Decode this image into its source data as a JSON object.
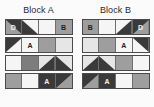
{
  "figure": {
    "type": "diagram"
  },
  "palette": {
    "dark": "#3a3a3a",
    "mid_dark": "#7d7d7d",
    "mid": "#9e9e9e",
    "light": "#cfcfcf",
    "pale": "#e6e6e6",
    "white": "#f5f5f5",
    "outline": "#4a4a4a",
    "label_light": "#f2f2f2",
    "label_dark": "#1f1f1f",
    "background": "#fbfbfb"
  },
  "blocks": [
    {
      "title": "Block A",
      "rows": [
        {
          "cells": [
            {
              "fill": "dark",
              "triangle": "bottom-left",
              "triangle_fill": "mid",
              "label": "D",
              "label_color": "label_light"
            },
            {
              "fill": "white",
              "triangle": "bottom-left",
              "triangle_fill": "dark",
              "label": "",
              "label_color": "label_dark"
            },
            {
              "fill": "white",
              "triangle": "none",
              "triangle_fill": "",
              "label": "",
              "label_color": "label_dark"
            },
            {
              "fill": "mid",
              "triangle": "none",
              "triangle_fill": "",
              "label": "B",
              "label_color": "label_dark"
            }
          ]
        },
        {
          "cells": [
            {
              "fill": "white",
              "triangle": "top-left",
              "triangle_fill": "dark",
              "label": "",
              "label_color": "label_dark"
            },
            {
              "fill": "white",
              "triangle": "none",
              "triangle_fill": "",
              "label": "A",
              "label_color": "label_dark"
            },
            {
              "fill": "mid",
              "triangle": "none",
              "triangle_fill": "",
              "label": "",
              "label_color": "label_dark"
            },
            {
              "fill": "pale",
              "triangle": "none",
              "triangle_fill": "",
              "label": "",
              "label_color": "label_dark"
            }
          ]
        },
        {
          "cells": [
            {
              "fill": "white",
              "triangle": "none",
              "triangle_fill": "",
              "label": "",
              "label_color": "label_dark"
            },
            {
              "fill": "mid_dark",
              "triangle": "none",
              "triangle_fill": "",
              "label": "",
              "label_color": "label_dark"
            },
            {
              "fill": "pale",
              "triangle": "bottom-right",
              "triangle_fill": "dark",
              "label": "",
              "label_color": "label_dark"
            },
            {
              "fill": "pale",
              "triangle": "bottom-left",
              "triangle_fill": "dark",
              "label": "",
              "label_color": "label_dark"
            }
          ]
        },
        {
          "cells": [
            {
              "fill": "mid",
              "triangle": "none",
              "triangle_fill": "",
              "label": "",
              "label_color": "label_dark"
            },
            {
              "fill": "white",
              "triangle": "none",
              "triangle_fill": "",
              "label": "",
              "label_color": "label_dark"
            },
            {
              "fill": "dark",
              "triangle": "none",
              "triangle_fill": "",
              "label": "A",
              "label_color": "label_light"
            },
            {
              "fill": "mid",
              "triangle": "top-left",
              "triangle_fill": "dark",
              "label": "",
              "label_color": "label_dark"
            }
          ]
        }
      ]
    },
    {
      "title": "Block B",
      "rows": [
        {
          "cells": [
            {
              "fill": "mid",
              "triangle": "none",
              "triangle_fill": "",
              "label": "B",
              "label_color": "label_dark"
            },
            {
              "fill": "white",
              "triangle": "none",
              "triangle_fill": "",
              "label": "",
              "label_color": "label_dark"
            },
            {
              "fill": "white",
              "triangle": "bottom-right",
              "triangle_fill": "dark",
              "label": "",
              "label_color": "label_dark"
            },
            {
              "fill": "dark",
              "triangle": "bottom-right",
              "triangle_fill": "mid",
              "label": "D",
              "label_color": "label_light"
            }
          ]
        },
        {
          "cells": [
            {
              "fill": "pale",
              "triangle": "none",
              "triangle_fill": "",
              "label": "",
              "label_color": "label_dark"
            },
            {
              "fill": "mid",
              "triangle": "none",
              "triangle_fill": "",
              "label": "",
              "label_color": "label_dark"
            },
            {
              "fill": "white",
              "triangle": "none",
              "triangle_fill": "",
              "label": "A",
              "label_color": "label_dark"
            },
            {
              "fill": "white",
              "triangle": "top-right",
              "triangle_fill": "dark",
              "label": "",
              "label_color": "label_dark"
            }
          ]
        },
        {
          "cells": [
            {
              "fill": "pale",
              "triangle": "bottom-right",
              "triangle_fill": "dark",
              "label": "",
              "label_color": "label_dark"
            },
            {
              "fill": "pale",
              "triangle": "bottom-left",
              "triangle_fill": "dark",
              "label": "",
              "label_color": "label_dark"
            },
            {
              "fill": "mid",
              "triangle": "none",
              "triangle_fill": "",
              "label": "",
              "label_color": "label_dark"
            },
            {
              "fill": "white",
              "triangle": "none",
              "triangle_fill": "",
              "label": "",
              "label_color": "label_dark"
            }
          ]
        },
        {
          "cells": [
            {
              "fill": "mid",
              "triangle": "top-left",
              "triangle_fill": "dark",
              "label": "",
              "label_color": "label_dark"
            },
            {
              "fill": "dark",
              "triangle": "none",
              "triangle_fill": "",
              "label": "A",
              "label_color": "label_light"
            },
            {
              "fill": "white",
              "triangle": "none",
              "triangle_fill": "",
              "label": "",
              "label_color": "label_dark"
            },
            {
              "fill": "mid",
              "triangle": "none",
              "triangle_fill": "",
              "label": "",
              "label_color": "label_dark"
            }
          ]
        }
      ]
    }
  ]
}
